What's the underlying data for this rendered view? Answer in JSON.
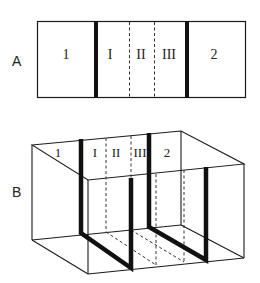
{
  "panels": {
    "a": {
      "label": "A",
      "regions": [
        "1",
        "I",
        "II",
        "III",
        "2"
      ]
    },
    "b": {
      "label": "B",
      "regions": [
        "1",
        "I",
        "II",
        "III",
        "2"
      ]
    }
  },
  "colors": {
    "line": "#1a1a1a",
    "background": "#ffffff"
  }
}
